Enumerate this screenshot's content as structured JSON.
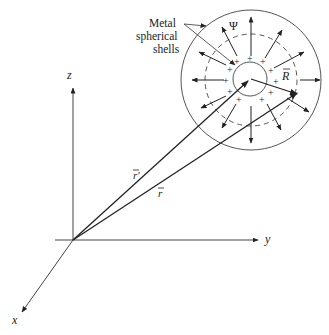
{
  "diagram": {
    "title": "",
    "axes": {
      "x_label": "x",
      "y_label": "y",
      "z_label": "z"
    },
    "vectors": {
      "r_prime_label": "r′",
      "r_label": "r",
      "R_label": "R"
    },
    "shell_label": {
      "line1": "Metal",
      "line2": "spherical",
      "line3": "shells"
    },
    "flux_label": "Ψ",
    "charge_symbol": "+",
    "colors": {
      "line": "#222222",
      "shell": "#555555",
      "background": "#ffffff"
    }
  }
}
